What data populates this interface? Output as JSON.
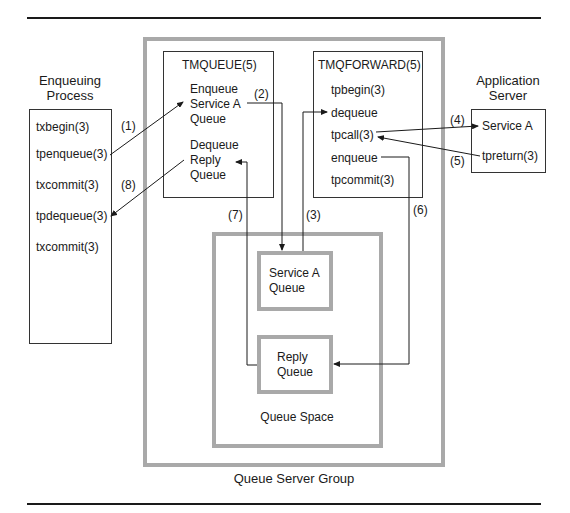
{
  "diagram": {
    "outer_group": {
      "label": "Queue Server Group"
    },
    "tmqueue": {
      "title": "TMQUEUE(5)",
      "enqueue_block": [
        "Enqueue",
        "Service A",
        "Queue"
      ],
      "dequeue_block": [
        "Dequeue",
        "Reply",
        "Queue"
      ]
    },
    "tmqforward": {
      "title": "TMQFORWARD(5)",
      "items": [
        "tpbegin(3)",
        "dequeue",
        "tpcall(3)",
        "enqueue",
        "tpcommit(3)"
      ]
    },
    "enqueuing_process": {
      "title_lines": [
        "Enqueuing",
        "Process"
      ],
      "items": [
        "txbegin(3)",
        "tpenqueue(3)",
        "txcommit(3)",
        "tpdequeue(3)",
        "txcommit(3)"
      ]
    },
    "application_server": {
      "title_lines": [
        "Application",
        "Server"
      ],
      "items": [
        "Service A",
        "tpreturn(3)"
      ]
    },
    "queue_space": {
      "label": "Queue Space",
      "service_a_queue": [
        "Service A",
        "Queue"
      ],
      "reply_queue": [
        "Reply",
        "Queue"
      ]
    },
    "steps": [
      "(1)",
      "(2)",
      "(3)",
      "(4)",
      "(5)",
      "(6)",
      "(7)",
      "(8)"
    ]
  }
}
